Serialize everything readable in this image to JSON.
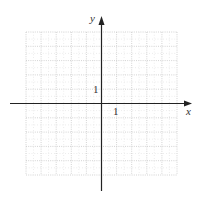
{
  "figure": {
    "type": "coordinate-grid",
    "x_axis_label": "x",
    "y_axis_label": "y",
    "x_tick_label": "1",
    "y_tick_label": "1",
    "x_range": [
      -5,
      5
    ],
    "y_range": [
      -5,
      5
    ],
    "grid_step": 1,
    "grid_style": "dotted",
    "colors": {
      "axis": "#222222",
      "grid": "#c8c8c8",
      "background": "#ffffff",
      "text": "#333333"
    }
  }
}
